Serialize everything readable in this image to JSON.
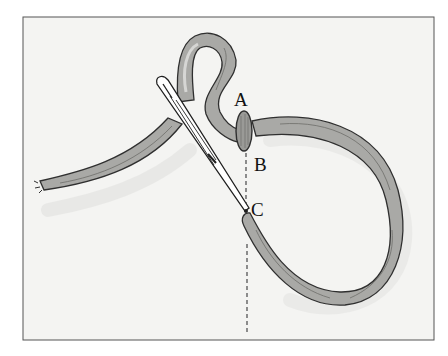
{
  "figure": {
    "labels": {
      "a": "A",
      "b": "B",
      "c": "C"
    },
    "colors": {
      "background": "#f4f4f2",
      "frame": "#555555",
      "thread_fill": "#a9a9a6",
      "thread_outline": "#2f2f2f",
      "shadow": "#e2e2e0",
      "needle_fill": "#ffffff",
      "dashed_line": "#555555"
    }
  }
}
